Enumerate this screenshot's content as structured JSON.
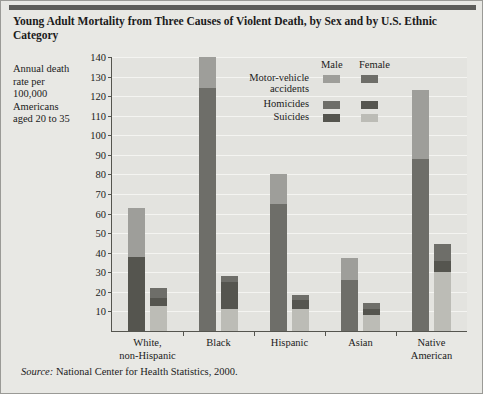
{
  "title": "Young Adult Mortality from Three Causes of Violent Death, by Sex and by U.S. Ethnic Category",
  "y_caption": "Annual death rate per 100,000 Americans aged 20 to 35",
  "source_prefix": "Source:",
  "source_text": " National Center for Health Statistics, 2000.",
  "legend": {
    "male_header": "Male",
    "female_header": "Female",
    "rows": [
      {
        "label": "Motor-vehicle accidents",
        "male_color": "#9e9e9a",
        "female_color": "#6e6e69"
      },
      {
        "label": "Homicides",
        "male_color": "#6e6e69",
        "female_color": "#55554f"
      },
      {
        "label": "Suicides",
        "male_color": "#55554f",
        "female_color": "#bcbcb6"
      }
    ]
  },
  "colors": {
    "page_background": "#e8e8e4",
    "plot_background": "#e3e3df",
    "axis": "#55554f",
    "gridline": "#f4f4f1",
    "male_motor_vehicle": "#9e9e9a",
    "male_homicides": "#6e6e69",
    "male_suicides": "#55554f",
    "female_motor_vehicle": "#6e6e69",
    "female_homicides": "#55554f",
    "female_suicides": "#bcbcb6"
  },
  "chart_data": {
    "type": "bar",
    "subtype": "stacked-grouped",
    "title": "Young Adult Mortality from Three Causes of Violent Death, by Sex and by U.S. Ethnic Category",
    "xlabel": "",
    "ylabel": "Annual death rate per 100,000 Americans aged 20 to 35",
    "ylim": [
      0,
      140
    ],
    "yticks": [
      10,
      20,
      30,
      40,
      50,
      60,
      70,
      80,
      90,
      100,
      110,
      120,
      130,
      140
    ],
    "ytick_labels": [
      "10",
      "20",
      "30",
      "40",
      "50",
      "60",
      "70",
      "80",
      "90",
      "100",
      "110",
      "120",
      "130",
      "140"
    ],
    "grid": true,
    "legend_position": "inside-top-right",
    "categories": [
      "White, non-Hispanic",
      "Black",
      "Hispanic",
      "Asian",
      "Native American"
    ],
    "groups": [
      "Male",
      "Female"
    ],
    "stack_order_bottom_to_top": [
      "Suicides",
      "Homicides",
      "Motor-vehicle accidents"
    ],
    "series": [
      {
        "name": "Male - Suicides",
        "values": [
          38,
          0,
          0,
          0,
          0
        ]
      },
      {
        "name": "Male - Homicides",
        "values": [
          0,
          124,
          65,
          26,
          88
        ]
      },
      {
        "name": "Male - Motor-vehicle accidents",
        "values": [
          25,
          16,
          15,
          11.5,
          35
        ]
      },
      {
        "name": "Female - Suicides",
        "values": [
          13,
          11,
          11,
          8,
          30
        ]
      },
      {
        "name": "Female - Homicides",
        "values": [
          4,
          14,
          5,
          3.5,
          6
        ]
      },
      {
        "name": "Female - Motor-vehicle accidents",
        "values": [
          5,
          3,
          2.5,
          3,
          8.5
        ]
      }
    ],
    "totals": {
      "Male": [
        63,
        140,
        80,
        37.5,
        123
      ],
      "Female": [
        22,
        28,
        18.5,
        14.5,
        44.5
      ]
    }
  }
}
